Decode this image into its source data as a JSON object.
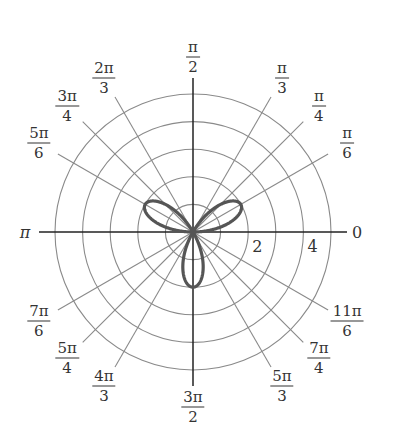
{
  "chart_data": {
    "type": "polar",
    "title": "",
    "equation": "r = 2 sin(3θ)",
    "curve": {
      "kind": "rose",
      "amplitude": 2,
      "k": 3,
      "function": "sin",
      "petals": 3,
      "petal_angles": [
        "π/6",
        "5π/6",
        "3π/2"
      ],
      "max_r": 2
    },
    "radial_axis": {
      "range": [
        0,
        5
      ],
      "circles": [
        1,
        2,
        3,
        4,
        5
      ],
      "tick_labels": [
        "2",
        "4"
      ]
    },
    "angular_ticks": [
      {
        "angle_deg": 0,
        "num": "0",
        "den": ""
      },
      {
        "angle_deg": 30,
        "num": "π",
        "den": "6"
      },
      {
        "angle_deg": 45,
        "num": "π",
        "den": "4"
      },
      {
        "angle_deg": 60,
        "num": "π",
        "den": "3"
      },
      {
        "angle_deg": 90,
        "num": "π",
        "den": "2"
      },
      {
        "angle_deg": 120,
        "num": "2π",
        "den": "3"
      },
      {
        "angle_deg": 135,
        "num": "3π",
        "den": "4"
      },
      {
        "angle_deg": 150,
        "num": "5π",
        "den": "6"
      },
      {
        "angle_deg": 180,
        "num": "π",
        "den": ""
      },
      {
        "angle_deg": 210,
        "num": "7π",
        "den": "6"
      },
      {
        "angle_deg": 225,
        "num": "5π",
        "den": "4"
      },
      {
        "angle_deg": 240,
        "num": "4π",
        "den": "3"
      },
      {
        "angle_deg": 270,
        "num": "3π",
        "den": "2"
      },
      {
        "angle_deg": 300,
        "num": "5π",
        "den": "3"
      },
      {
        "angle_deg": 315,
        "num": "7π",
        "den": "4"
      },
      {
        "angle_deg": 330,
        "num": "11π",
        "den": "6"
      }
    ],
    "grid": true,
    "colors": {
      "curve": "#555555",
      "grid": "#8a8a8a",
      "axis": "#222222",
      "text": "#333333"
    }
  }
}
